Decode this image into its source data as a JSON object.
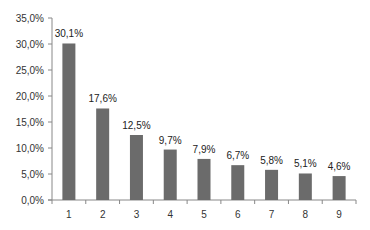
{
  "chart_data": {
    "type": "bar",
    "title": "",
    "xlabel": "",
    "ylabel": "",
    "categories": [
      "1",
      "2",
      "3",
      "4",
      "5",
      "6",
      "7",
      "8",
      "9"
    ],
    "values": [
      30.1,
      17.6,
      12.5,
      9.7,
      7.9,
      6.7,
      5.8,
      5.1,
      4.6
    ],
    "data_labels": [
      "30,1%",
      "17,6%",
      "12,5%",
      "9,7%",
      "7,9%",
      "6,7%",
      "5,8%",
      "5,1%",
      "4,6%"
    ],
    "ylim": [
      0,
      35
    ],
    "yticks": [
      0,
      5,
      10,
      15,
      20,
      25,
      30,
      35
    ],
    "ytick_labels": [
      "0,0%",
      "5,0%",
      "10,0%",
      "15,0%",
      "20,0%",
      "25,0%",
      "30,0%",
      "35,0%"
    ],
    "grid": false,
    "legend": null,
    "bar_color": "#6b6b6b"
  }
}
